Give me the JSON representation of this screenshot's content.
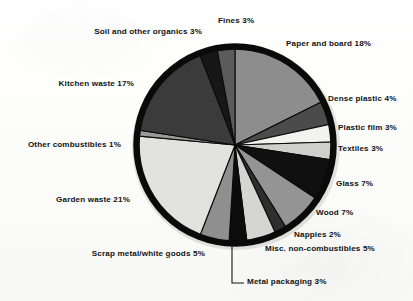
{
  "chart_data": {
    "type": "pie",
    "title": "",
    "subtitle": "",
    "xlabel": "",
    "ylabel": "",
    "legend_position": "callout-labels",
    "grid": false,
    "units": "percent",
    "start_angle_deg": 0,
    "direction": "clockwise",
    "categories": [
      "Paper and board",
      "Dense plastic",
      "Plastic film",
      "Textiles",
      "Glass",
      "Wood",
      "Nappies",
      "Misc. non-combustibles",
      "Metal packaging",
      "Scrap metal/white goods",
      "Garden waste",
      "Other combustibles",
      "Kitchen waste",
      "Soil and other organics",
      "Fines"
    ],
    "values": [
      18,
      4,
      3,
      3,
      7,
      7,
      2,
      5,
      3,
      5,
      21,
      1,
      17,
      3,
      3
    ],
    "slice_colors": [
      "#8d8d8d",
      "#4b4b4b",
      "#f2f2f0",
      "#cfcfcd",
      "#101010",
      "#949494",
      "#2e2e2e",
      "#d5d5d3",
      "#0c0c0c",
      "#8f8f8f",
      "#e2e2e0",
      "#9a9a9a",
      "#3b3b3b",
      "#171717",
      "#5b5b5b"
    ],
    "slices": [
      {
        "label": "Paper and board",
        "value": 18,
        "label_text": "Paper and board 18%",
        "color": "#8d8d8d"
      },
      {
        "label": "Dense plastic",
        "value": 4,
        "label_text": "Dense plastic 4%",
        "color": "#4b4b4b"
      },
      {
        "label": "Plastic film",
        "value": 3,
        "label_text": "Plastic film 3%",
        "color": "#f2f2f0"
      },
      {
        "label": "Textiles",
        "value": 3,
        "label_text": "Textiles 3%",
        "color": "#cfcfcd"
      },
      {
        "label": "Glass",
        "value": 7,
        "label_text": "Glass 7%",
        "color": "#101010"
      },
      {
        "label": "Wood",
        "value": 7,
        "label_text": "Wood 7%",
        "color": "#949494"
      },
      {
        "label": "Nappies",
        "value": 2,
        "label_text": "Nappies 2%",
        "color": "#2e2e2e"
      },
      {
        "label": "Misc. non-combustibles",
        "value": 5,
        "label_text": "Misc. non-combustibles 5%",
        "color": "#d5d5d3"
      },
      {
        "label": "Metal packaging",
        "value": 3,
        "label_text": "Metal packaging 3%",
        "color": "#0c0c0c"
      },
      {
        "label": "Scrap metal/white goods",
        "value": 5,
        "label_text": "Scrap metal/white goods 5%",
        "color": "#8f8f8f"
      },
      {
        "label": "Garden waste",
        "value": 21,
        "label_text": "Garden waste 21%",
        "color": "#e2e2e0"
      },
      {
        "label": "Other combustibles",
        "value": 1,
        "label_text": "Other combustibles 1%",
        "color": "#9a9a9a"
      },
      {
        "label": "Kitchen waste",
        "value": 17,
        "label_text": "Kitchen waste 17%",
        "color": "#3b3b3b"
      },
      {
        "label": "Soil and other organics",
        "value": 3,
        "label_text": "Soil and other organics 3%",
        "color": "#171717"
      },
      {
        "label": "Fines",
        "value": 3,
        "label_text": "Fines 3%",
        "color": "#5b5b5b"
      }
    ],
    "total": 100
  },
  "labels": {
    "fines": "Fines 3%",
    "soil_and_other_organics": "Soil and other organics 3%",
    "paper_and_board": "Paper and board 18%",
    "kitchen_waste": "Kitchen waste 17%",
    "dense_plastic": "Dense plastic 4%",
    "plastic_film": "Plastic film 3%",
    "textiles": "Textiles 3%",
    "other_combustibles": "Other combustibles 1%",
    "glass": "Glass 7%",
    "garden_waste": "Garden waste 21%",
    "wood": "Wood 7%",
    "nappies": "Nappies 2%",
    "misc_non_combustibles": "Misc. non-combustibles 5%",
    "scrap_metal_white_goods": "Scrap metal/white goods 5%",
    "metal_packaging": "Metal packaging 3%"
  },
  "style": {
    "ring_color": "#0a0a0a",
    "separator_color": "#0a0a0a",
    "label_color": "#121212",
    "background": "#fdfdfb"
  }
}
